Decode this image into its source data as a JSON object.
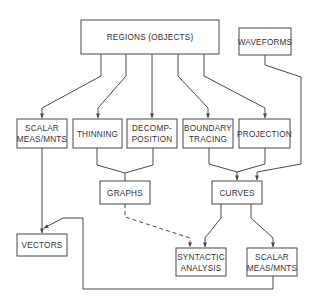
{
  "diagram": {
    "type": "flowchart",
    "nodes": {
      "regions": {
        "label": "REGIONS (OBJECTS)",
        "lines": [
          "REGIONS (OBJECTS)"
        ]
      },
      "waveforms": {
        "label": "WAVEFORMS",
        "lines": [
          "WAVEFORMS"
        ]
      },
      "scalar_top": {
        "label": "SCALAR MEAS/MNTS",
        "lines": [
          "SCALAR",
          "MEAS/MNTS"
        ]
      },
      "thinning": {
        "label": "THINNING",
        "lines": [
          "THINNING"
        ]
      },
      "decomposition": {
        "label": "DECOMP-POSITION",
        "lines": [
          "DECOMP-",
          "POSITION"
        ]
      },
      "boundary_tracing": {
        "label": "BOUNDARY TRACING",
        "lines": [
          "BOUNDARY",
          "TRACING"
        ]
      },
      "projection": {
        "label": "PROJECTION",
        "lines": [
          "PROJECTION"
        ]
      },
      "graphs": {
        "label": "GRAPHS",
        "lines": [
          "GRAPHS"
        ]
      },
      "curves": {
        "label": "CURVES",
        "lines": [
          "CURVES"
        ]
      },
      "vectors": {
        "label": "VECTORS",
        "lines": [
          "VECTORS"
        ]
      },
      "syntactic_analysis": {
        "label": "SYNTACTIC ANALYSIS",
        "lines": [
          "SYNTACTIC",
          "ANALYSIS"
        ]
      },
      "scalar_bottom": {
        "label": "SCALAR MEAS/MNTS",
        "lines": [
          "SCALAR",
          "MEAS/MNTS"
        ]
      }
    },
    "edges": [
      {
        "from": "REGIONS (OBJECTS)",
        "to": "SCALAR MEAS/MNTS",
        "style": "solid"
      },
      {
        "from": "REGIONS (OBJECTS)",
        "to": "THINNING",
        "style": "solid"
      },
      {
        "from": "REGIONS (OBJECTS)",
        "to": "DECOMP-POSITION",
        "style": "solid"
      },
      {
        "from": "REGIONS (OBJECTS)",
        "to": "BOUNDARY TRACING",
        "style": "solid"
      },
      {
        "from": "REGIONS (OBJECTS)",
        "to": "PROJECTION",
        "style": "solid"
      },
      {
        "from": "WAVEFORMS",
        "to": "CURVES",
        "style": "solid"
      },
      {
        "from": "THINNING",
        "to": "GRAPHS",
        "style": "solid"
      },
      {
        "from": "DECOMP-POSITION",
        "to": "GRAPHS",
        "style": "solid"
      },
      {
        "from": "BOUNDARY TRACING",
        "to": "CURVES",
        "style": "solid"
      },
      {
        "from": "PROJECTION",
        "to": "CURVES",
        "style": "solid"
      },
      {
        "from": "SCALAR MEAS/MNTS",
        "to": "VECTORS",
        "style": "solid"
      },
      {
        "from": "GRAPHS",
        "to": "SYNTACTIC ANALYSIS",
        "style": "dashed"
      },
      {
        "from": "CURVES",
        "to": "SYNTACTIC ANALYSIS",
        "style": "solid"
      },
      {
        "from": "CURVES",
        "to": "SCALAR MEAS/MNTS (bottom)",
        "style": "solid"
      },
      {
        "from": "SCALAR MEAS/MNTS (bottom)",
        "to": "VECTORS",
        "style": "solid"
      }
    ],
    "colors": {
      "line": "#4a4a4a",
      "text": "#333333",
      "background": "#ffffff"
    }
  }
}
